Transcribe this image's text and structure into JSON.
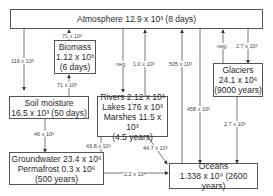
{
  "diagram": {
    "nodes": {
      "atmosphere": {
        "label": "Atmosphere 12.9 x 10³ (8 days)"
      },
      "biomass": {
        "line1": "Biomass",
        "line2": "1.12 x 10³",
        "line3": "(6 days)"
      },
      "soil": {
        "line1": "Soil moisture",
        "line2": "16.5 x 10³ (50 days)"
      },
      "surface": {
        "line1": "Rivers 2.12 x 10³",
        "line2": "Lakes 176 x 10³",
        "line3": "Marshes 11.5 x 10³",
        "line4": "(4.5 years)"
      },
      "glaciers": {
        "line1": "Glaciers",
        "line2": "24.1 x 10⁶",
        "line3": "(9000 years)"
      },
      "groundwater": {
        "line1": "Groundwater 23.4 x 10⁶",
        "line2": "Permafrost 0.3 x 10⁶",
        "line3": "(500 years)"
      },
      "oceans": {
        "line1": "Oceans",
        "line2": "1.338 x 10⁹ (2600 years)"
      }
    },
    "fluxes": {
      "atm_to_soil": "116 x 10³",
      "biomass_to_atm": "71 x 10³",
      "soil_to_biomass": "71 x 10³",
      "atm_to_surface": "neg.",
      "surface_to_atm": "1.0 x 10³",
      "oceans_to_atm": "505 x 10³",
      "atm_to_oceans": "458 x 10³",
      "glaciers_to_atm": "neg.",
      "atm_to_glaciers": "2.7 x 10³",
      "glaciers_to_oceans": "2.7 x 10³",
      "soil_to_groundwater": "46 x 10³",
      "groundwater_to_surface": "43.8 x 10³",
      "surface_to_oceans": "44.7 x 10³",
      "groundwater_to_oceans": "2.2 x 10³"
    }
  }
}
